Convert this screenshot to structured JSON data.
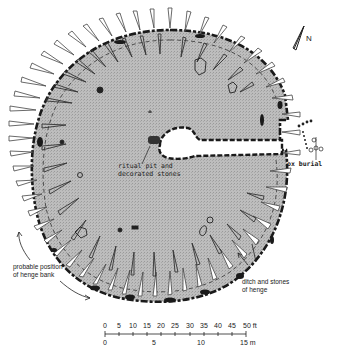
{
  "diagram": {
    "type": "archaeological site plan (henge)",
    "north_label": "N",
    "labels": {
      "ritual_pit": [
        "ritual pit and",
        "decorated stones"
      ],
      "ox_burial": "ox burial",
      "henge_bank": [
        "probable position",
        "of henge bank"
      ],
      "ditch": [
        "ditch and stones",
        "of henge"
      ]
    },
    "scale": {
      "feet_ticks": [
        "0",
        "5",
        "10",
        "15",
        "20",
        "25",
        "30",
        "35",
        "40",
        "45",
        "50 ft"
      ],
      "metre_ticks": [
        "0",
        "5",
        "10",
        "15 m"
      ]
    },
    "colors": {
      "interior_fill": "#b9b9b9",
      "ditch": "#222222",
      "stake_outline": "#444444",
      "background": "#ffffff"
    }
  }
}
